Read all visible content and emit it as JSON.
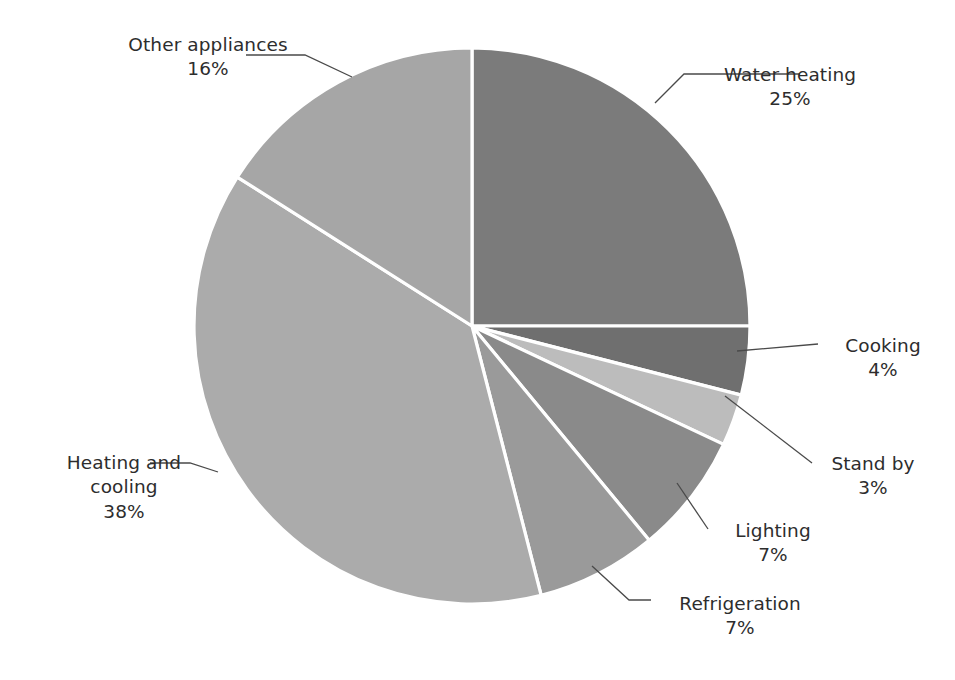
{
  "chart_data": {
    "type": "pie",
    "title": "",
    "subtitle": "",
    "legend_position": "none",
    "labels_outside": true,
    "start_angle_deg": 0,
    "direction": "clockwise",
    "categories": [
      "Water heating",
      "Cooking",
      "Stand by",
      "Lighting",
      "Refrigeration",
      "Heating and cooling",
      "Other appliances"
    ],
    "values": [
      25,
      4,
      3,
      7,
      7,
      38,
      16
    ],
    "value_labels": [
      "25%",
      "4%",
      "3%",
      "7%",
      "7%",
      "38%",
      "16%"
    ],
    "unit": "%",
    "total": 100,
    "colors": [
      "#7b7b7b",
      "#6f6f6f",
      "#bcbcbc",
      "#8a8a8a",
      "#9a9a9a",
      "#ababab",
      "#a6a6a6"
    ],
    "slice_border_color": "#ffffff",
    "leader_line_color": "#4a4a4a",
    "background_color": "#ffffff"
  },
  "geometry": {
    "center_x": 472,
    "center_y": 326,
    "radius": 278
  },
  "slices": [
    {
      "name": "Water heating",
      "percent_label": "25%",
      "value": 25,
      "color": "#7b7b7b",
      "label_lines": [
        "Water heating",
        "25%"
      ]
    },
    {
      "name": "Cooking",
      "percent_label": "4%",
      "value": 4,
      "color": "#6f6f6f",
      "label_lines": [
        "Cooking",
        "4%"
      ]
    },
    {
      "name": "Stand by",
      "percent_label": "3%",
      "value": 3,
      "color": "#bcbcbc",
      "label_lines": [
        "Stand by",
        "3%"
      ]
    },
    {
      "name": "Lighting",
      "percent_label": "7%",
      "value": 7,
      "color": "#8a8a8a",
      "label_lines": [
        "Lighting",
        "7%"
      ]
    },
    {
      "name": "Refrigeration",
      "percent_label": "7%",
      "value": 7,
      "color": "#9a9a9a",
      "label_lines": [
        "Refrigeration",
        "7%"
      ]
    },
    {
      "name": "Heating and cooling",
      "percent_label": "38%",
      "value": 38,
      "color": "#ababab",
      "label_lines": [
        "Heating and",
        "cooling",
        "38%"
      ]
    },
    {
      "name": "Other appliances",
      "percent_label": "16%",
      "value": 16,
      "color": "#a6a6a6",
      "label_lines": [
        "Other appliances",
        "16%"
      ]
    }
  ],
  "labels": {
    "water_heating": {
      "name": "Water heating",
      "pct": "25%"
    },
    "cooking": {
      "name": "Cooking",
      "pct": "4%"
    },
    "stand_by": {
      "name": "Stand by",
      "pct": "3%"
    },
    "lighting": {
      "name": "Lighting",
      "pct": "7%"
    },
    "refrigeration": {
      "name": "Refrigeration",
      "pct": "7%"
    },
    "heating_cooling": {
      "name_line1": "Heating and",
      "name_line2": "cooling",
      "pct": "38%"
    },
    "other_appliances": {
      "name": "Other appliances",
      "pct": "16%"
    }
  }
}
